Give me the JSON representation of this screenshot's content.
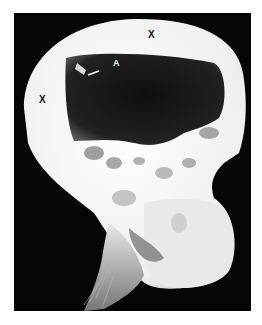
{
  "image": {
    "description": "Lateral skull radiograph (X-ray) showing a skull in profile facing right, with thickened cranial vault and annotations",
    "annotations": [
      {
        "id": "x-top",
        "text": "X",
        "position": "upper cranial vault"
      },
      {
        "id": "x-left",
        "text": "X",
        "position": "posterior cranial vault"
      },
      {
        "id": "a",
        "text": "A",
        "position": "inside cranial cavity near upper-left, with arrow pointing left to a small bright structure"
      }
    ],
    "colors": {
      "background": "#060606",
      "bone": "#f4f4f4",
      "cavity": "#1a1a1a",
      "page": "#ffffff"
    }
  }
}
